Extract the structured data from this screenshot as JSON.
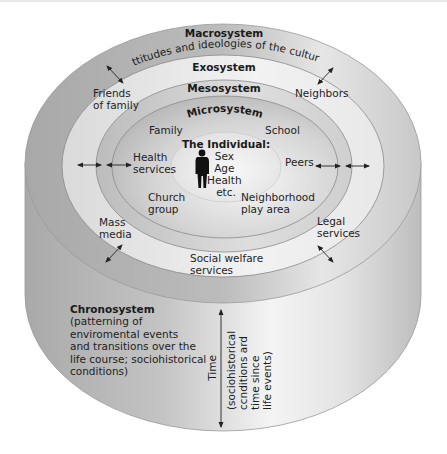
{
  "colors": {
    "background": "#ffffff",
    "cylinder_side": "#b4b4b4",
    "macro_ring": "#b0b0b0",
    "exo_ring": "#e2e2e2",
    "meso_ring": "#c6c6c6",
    "micro_ring": "#bdbdbd",
    "individual_center": "#e6e6e6",
    "text": "#1e1e1e",
    "figure": "#111111"
  },
  "systems": {
    "macrosystem": {
      "title": "Macrosystem",
      "description": "Attitudes and ideologies of the culture"
    },
    "exosystem": {
      "title": "Exosystem",
      "items": [
        {
          "line1": "Friends",
          "line2": "of family"
        },
        {
          "line1": "Neighbors",
          "line2": ""
        },
        {
          "line1": "Mass",
          "line2": "media"
        },
        {
          "line1": "Legal",
          "line2": "services"
        },
        {
          "line1": "Social welfare",
          "line2": "services"
        }
      ]
    },
    "mesosystem": {
      "title": "Mesosystem"
    },
    "microsystem": {
      "title": "Microsystem",
      "items": [
        {
          "line1": "Family",
          "line2": ""
        },
        {
          "line1": "School",
          "line2": ""
        },
        {
          "line1": "Health",
          "line2": "services"
        },
        {
          "line1": "Peers",
          "line2": ""
        },
        {
          "line1": "Church",
          "line2": "group"
        },
        {
          "line1": "Neighborhood",
          "line2": "play area"
        }
      ]
    },
    "individual": {
      "title": "The Individual:",
      "attributes": [
        "Sex",
        "Age",
        "Health",
        "etc."
      ]
    },
    "chronosystem": {
      "title": "Chronosystem",
      "description_lines": [
        "(patterning of",
        "enviromental events",
        "and transitions over the",
        "life course; sociohistorical",
        "conditions)"
      ],
      "time_axis_label": "Time",
      "time_axis_note_lines": [
        "(sociohistorical",
        "ccnditions ard",
        "time since",
        "life events)"
      ]
    }
  }
}
